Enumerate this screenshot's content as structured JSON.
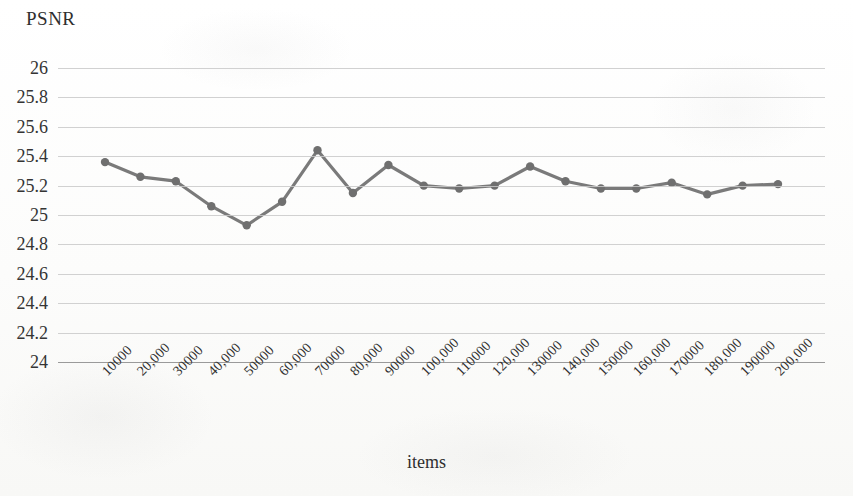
{
  "chart_data": {
    "type": "line",
    "title": "",
    "xlabel": "items",
    "ylabel": "PSNR",
    "ylim": [
      24,
      26
    ],
    "ytick_step": 0.2,
    "grid": true,
    "legend": null,
    "legend_position": "none",
    "marker": "circle",
    "line_color": "#7a7a7a",
    "marker_color": "#6f6f6f",
    "gridline_color": "#c9c9c9",
    "axis_color": "#9a9a9a",
    "background_color": "#fdfdfc",
    "text_color": "#2e2e2e",
    "ytick_labels": [
      "26",
      "25.8",
      "25.6",
      "25.4",
      "25.2",
      "25",
      "24.8",
      "24.6",
      "24.4",
      "24.2",
      "24"
    ],
    "ytick_values": [
      26,
      25.8,
      25.6,
      25.4,
      25.2,
      25,
      24.8,
      24.6,
      24.4,
      24.2,
      24
    ],
    "categories": [
      "10000",
      "20,000",
      "30000",
      "40,000",
      "50000",
      "60,000",
      "70000",
      "80,000",
      "90000",
      "100,000",
      "110000",
      "120,000",
      "130000",
      "140,000",
      "150000",
      "160,000",
      "170000",
      "180,000",
      "190000",
      "200,000"
    ],
    "x": [
      10000,
      20000,
      30000,
      40000,
      50000,
      60000,
      70000,
      80000,
      90000,
      100000,
      110000,
      120000,
      130000,
      140000,
      150000,
      160000,
      170000,
      180000,
      190000,
      200000
    ],
    "values": [
      25.36,
      25.26,
      25.23,
      25.06,
      24.93,
      25.09,
      25.44,
      25.15,
      25.34,
      25.2,
      25.18,
      25.2,
      25.33,
      25.23,
      25.18,
      25.18,
      25.22,
      25.14,
      25.2,
      25.21
    ]
  }
}
